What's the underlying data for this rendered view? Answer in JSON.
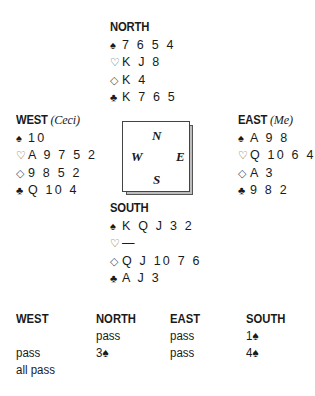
{
  "hands": {
    "north": {
      "label": "NORTH",
      "who": "",
      "spades": "7654",
      "hearts": "KJ8",
      "diamonds": "K4",
      "clubs": "K765"
    },
    "west": {
      "label": "WEST",
      "who": "(Ceci)",
      "spades": "10",
      "hearts": "A9752",
      "diamonds": "9852",
      "clubs": "Q104"
    },
    "east": {
      "label": "EAST",
      "who": "(Me)",
      "spades": "A98",
      "hearts": "Q10643",
      "diamonds": "A3",
      "clubs": "982"
    },
    "south": {
      "label": "SOUTH",
      "who": "",
      "spades": "KQJ32",
      "hearts": "—",
      "diamonds": "QJ1076",
      "clubs": "AJ3"
    }
  },
  "suits": {
    "spade": "♠",
    "heart": "♡",
    "diamond": "◇",
    "club": "♣"
  },
  "compass": {
    "n": "N",
    "w": "W",
    "e": "E",
    "s": "S"
  },
  "bidding": {
    "headers": [
      "WEST",
      "NORTH",
      "EAST",
      "SOUTH"
    ],
    "columns": [
      [
        "",
        "pass",
        "all pass"
      ],
      [
        "pass",
        "3♠"
      ],
      [
        "pass",
        "pass"
      ],
      [
        "1♠",
        "4♠"
      ]
    ]
  }
}
